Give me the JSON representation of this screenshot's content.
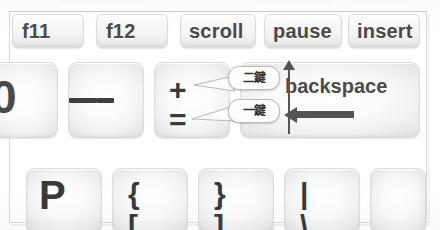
{
  "document": {
    "type": "keyboard-diagram-scan",
    "language": "zh-Hant",
    "frame_color": "#d9d9d9",
    "key_face_color": "#fbfbfb",
    "key_edge_color": "#e4e4e4",
    "glyph_color": "#3f3f3f",
    "annotation_color": "#555555"
  },
  "function_row": {
    "keys": [
      {
        "label": "f11",
        "name": "key-f11"
      },
      {
        "label": "f12",
        "name": "key-f12"
      },
      {
        "label": "scroll",
        "name": "key-scroll"
      },
      {
        "label": "pause",
        "name": "key-pause"
      },
      {
        "label": "insert",
        "name": "key-insert"
      }
    ]
  },
  "symbol_row": {
    "partial_key": {
      "glyph": "0"
    },
    "minus_key": {
      "upper": "_",
      "lower": "-"
    },
    "equal_key": {
      "upper": "+",
      "lower": "="
    },
    "backspace_key": {
      "label": "backspace"
    }
  },
  "letter_row": {
    "keys": [
      {
        "upper": "P",
        "lower": "",
        "name": "key-p"
      },
      {
        "upper": "{",
        "lower": "[",
        "name": "key-left-brace"
      },
      {
        "upper": "}",
        "lower": "]",
        "name": "key-right-brace"
      },
      {
        "upper": "|",
        "lower": "\\",
        "name": "key-pipe"
      }
    ]
  },
  "callouts": [
    {
      "text": "二鍵",
      "target": "+",
      "name": "callout-two-key"
    },
    {
      "text": "一鍵",
      "target": "=",
      "name": "callout-one-key"
    }
  ],
  "annotations": {
    "up_arrow": "shift-direction-arrow",
    "left_arrow": "backspace-direction-arrow"
  }
}
